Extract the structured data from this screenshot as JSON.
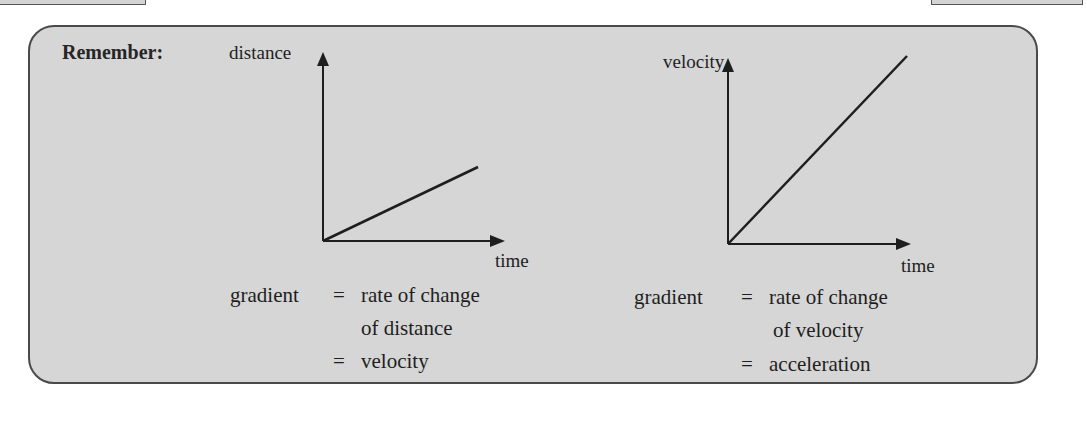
{
  "heading": "Remember:",
  "graphs": [
    {
      "y_label": "distance",
      "x_label": "time",
      "gradient_label": "gradient",
      "equals1": "=",
      "line1": "rate of change",
      "line2": "of distance",
      "equals2": "=",
      "result": "velocity"
    },
    {
      "y_label": "velocity",
      "x_label": "time",
      "gradient_label": "gradient",
      "equals1": "=",
      "line1": "rate of change",
      "line2": "of velocity",
      "equals2": "=",
      "result": "acceleration"
    }
  ],
  "colors": {
    "panel_bg": "#d6d6d6",
    "border": "#4a4a4a",
    "text": "#1e1e1e"
  }
}
